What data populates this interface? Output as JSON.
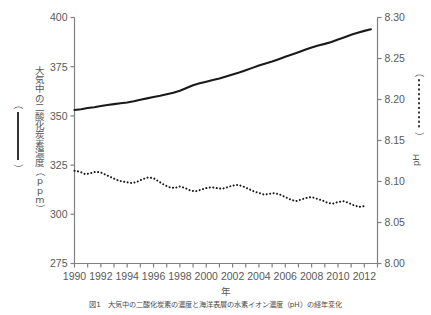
{
  "figure": {
    "caption": "図1　大気中の二酸化炭素の濃度と海洋表層の水素イオン濃度（pH）の経年変化",
    "background": "#ffffff",
    "line_color": "#1a1a1a",
    "axis_color": "#808080",
    "text_color": "#595959"
  },
  "axes": {
    "left": {
      "title": "大気中の二酸化炭素濃度（ppm）",
      "ticks": [
        "275",
        "300",
        "325",
        "350",
        "375",
        "400"
      ],
      "min": 275,
      "max": 400
    },
    "right": {
      "title": "pH",
      "ticks": [
        "8.00",
        "8.05",
        "8.10",
        "8.15",
        "8.20",
        "8.25",
        "8.30"
      ],
      "min": 8.0,
      "max": 8.3
    },
    "bottom": {
      "title": "年",
      "ticks": [
        "1990",
        "1992",
        "1994",
        "1996",
        "1998",
        "2000",
        "2002",
        "2004",
        "2006",
        "2008",
        "2010",
        "2012"
      ],
      "min": 1990,
      "max": 2013
    }
  },
  "legend": {
    "co2_marker": "solid-line",
    "ph_marker": "dotted-line",
    "co2_bracket": "（　）",
    "ph_bracket": "（　）"
  },
  "chart_data": {
    "type": "line",
    "title": "",
    "xlabel": "年",
    "ylabel": "大気中の二酸化炭素濃度（ppm）",
    "y2label": "pH",
    "xlim": [
      1990,
      2013
    ],
    "ylim": [
      275,
      400
    ],
    "y2lim": [
      8.0,
      8.3
    ],
    "grid": false,
    "legend_position": "outside-left-and-right",
    "series": [
      {
        "name": "大気中の二酸化炭素濃度（ppm）",
        "axis": "left",
        "style": "solid",
        "color": "#1a1a1a",
        "x": [
          1990,
          1990.5,
          1991,
          1991.5,
          1992,
          1992.5,
          1993,
          1993.5,
          1994,
          1994.5,
          1995,
          1995.5,
          1996,
          1996.5,
          1997,
          1997.5,
          1998,
          1998.5,
          1999,
          1999.5,
          2000,
          2000.5,
          2001,
          2001.5,
          2002,
          2002.5,
          2003,
          2003.5,
          2004,
          2004.5,
          2005,
          2005.5,
          2006,
          2006.5,
          2007,
          2007.5,
          2008,
          2008.5,
          2009,
          2009.5,
          2010,
          2010.5,
          2011,
          2011.5,
          2012,
          2012.5
        ],
        "values": [
          353.0,
          353.4,
          354.0,
          354.4,
          355.0,
          355.5,
          356.0,
          356.4,
          356.8,
          357.4,
          358.2,
          358.9,
          359.6,
          360.2,
          361.0,
          361.8,
          362.8,
          364.2,
          365.6,
          366.6,
          367.4,
          368.2,
          369.0,
          370.0,
          371.0,
          372.0,
          373.2,
          374.4,
          375.6,
          376.6,
          377.6,
          378.8,
          380.0,
          381.2,
          382.4,
          383.6,
          384.8,
          385.8,
          386.6,
          387.6,
          388.8,
          390.0,
          391.2,
          392.2,
          393.2,
          394.0
        ]
      },
      {
        "name": "pH",
        "axis": "right",
        "style": "dotted",
        "color": "#1a1a1a",
        "x": [
          1990,
          1990.4,
          1990.8,
          1991.2,
          1991.6,
          1992,
          1992.4,
          1992.8,
          1993.2,
          1993.6,
          1994,
          1994.4,
          1994.8,
          1995.2,
          1995.6,
          1996,
          1996.4,
          1996.8,
          1997.2,
          1997.6,
          1998,
          1998.4,
          1998.8,
          1999.2,
          1999.6,
          2000,
          2000.4,
          2000.8,
          2001.2,
          2001.6,
          2002,
          2002.4,
          2002.8,
          2003.2,
          2003.6,
          2004,
          2004.4,
          2004.8,
          2005.2,
          2005.6,
          2006,
          2006.4,
          2006.8,
          2007.2,
          2007.6,
          2008,
          2008.4,
          2008.8,
          2009.2,
          2009.6,
          2010,
          2010.4,
          2010.8,
          2011.2,
          2011.6,
          2012
        ],
        "values": [
          8.113,
          8.112,
          8.109,
          8.11,
          8.112,
          8.111,
          8.108,
          8.105,
          8.102,
          8.1,
          8.099,
          8.098,
          8.1,
          8.103,
          8.105,
          8.104,
          8.1,
          8.096,
          8.093,
          8.092,
          8.094,
          8.092,
          8.089,
          8.088,
          8.09,
          8.092,
          8.093,
          8.092,
          8.091,
          8.093,
          8.095,
          8.096,
          8.094,
          8.091,
          8.088,
          8.086,
          8.084,
          8.085,
          8.086,
          8.084,
          8.081,
          8.078,
          8.076,
          8.078,
          8.08,
          8.081,
          8.079,
          8.077,
          8.074,
          8.073,
          8.075,
          8.076,
          8.074,
          8.071,
          8.069,
          8.07
        ]
      }
    ]
  }
}
